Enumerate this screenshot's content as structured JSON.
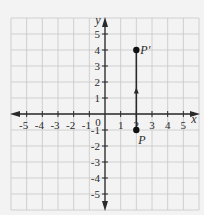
{
  "figure": {
    "background": "#f3f3f3",
    "grid_color": "#c6c6c6",
    "axis_color": "#2a2a2a",
    "x_axis_label": "x",
    "y_axis_label": "y",
    "origin_label": "0",
    "x_ticks": [
      "-5",
      "-4",
      "-3",
      "-2",
      "-1",
      "1",
      "2",
      "3",
      "4",
      "5"
    ],
    "y_ticks": [
      "5",
      "4",
      "3",
      "2",
      "1",
      "-1",
      "-2",
      "-3",
      "-4",
      "-5"
    ],
    "points": [
      {
        "label": "P",
        "x": 2,
        "y": -1
      },
      {
        "label": "P'",
        "x": 2,
        "y": 4
      }
    ],
    "segment": {
      "from": "P",
      "to": "P'",
      "direction": "up"
    }
  },
  "chart_data": {
    "type": "scatter",
    "title": "",
    "xlabel": "x",
    "ylabel": "y",
    "xlim": [
      -6,
      6
    ],
    "ylim": [
      -6,
      6
    ],
    "grid": true,
    "x_tick_labels": [
      "-5",
      "-4",
      "-3",
      "-2",
      "-1",
      "0",
      "1",
      "2",
      "3",
      "4",
      "5"
    ],
    "y_tick_labels": [
      "-5",
      "-4",
      "-3",
      "-2",
      "-1",
      "1",
      "2",
      "3",
      "4",
      "5"
    ],
    "series": [
      {
        "name": "points",
        "points": [
          {
            "label": "P",
            "x": 2,
            "y": -1
          },
          {
            "label": "P'",
            "x": 2,
            "y": 4
          }
        ]
      }
    ],
    "annotations": [
      "Vertical translation arrow from P(2,-1) up to P'(2,4)"
    ]
  }
}
